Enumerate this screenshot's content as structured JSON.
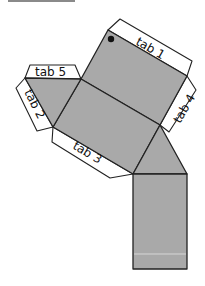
{
  "diagram": {
    "type": "net",
    "colors": {
      "face": "#a9a9a9",
      "tab": "#ffffff",
      "outline": "#222222"
    },
    "tabs": [
      {
        "id": "tab1",
        "label": "tab 1"
      },
      {
        "id": "tab2",
        "label": "tab 2"
      },
      {
        "id": "tab3",
        "label": "tab 3"
      },
      {
        "id": "tab4",
        "label": "tab 4"
      },
      {
        "id": "tab5",
        "label": "tab 5"
      }
    ],
    "faces": [
      "top-square",
      "middle-square",
      "left-triangle",
      "right-triangle",
      "bottom-rectangle"
    ],
    "marker": "black-dot"
  }
}
